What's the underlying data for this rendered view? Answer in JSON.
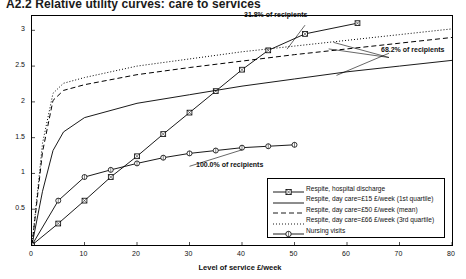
{
  "title": "A2.2  Relative utility curves: care to services",
  "axes": {
    "ylabel": "Change in perception",
    "xlabel": "Level of service £/week",
    "yticks": [
      "0.5",
      "1",
      "1.5",
      "2",
      "2.5",
      "3"
    ],
    "xticks": [
      "0",
      "10",
      "20",
      "30",
      "40",
      "50",
      "60",
      "70",
      "80"
    ]
  },
  "annotations": [
    {
      "text": "31.8% of recipients"
    },
    {
      "text": "68.2% of recipients"
    },
    {
      "text": "100.0% of recipients"
    }
  ],
  "legend": {
    "items": [
      {
        "label": "Respite, hospital discharge",
        "style": "solid-square-marker"
      },
      {
        "label": "Respite, day care=£15 £/week (1st quartile)",
        "style": "solid-line"
      },
      {
        "label": "Respite, day care=£50 £/week (mean)",
        "style": "dashed-line"
      },
      {
        "label": "Respite, day care=£66 £/week (3rd quartile)",
        "style": "dotted-line"
      },
      {
        "label": "Nursing visits",
        "style": "solid-circle-marker"
      }
    ]
  },
  "chart_data": {
    "type": "line",
    "title": "A2.2  Relative utility curves: care to services",
    "xlabel": "Level of service £/week",
    "ylabel": "Change in perception",
    "xlim": [
      0,
      80
    ],
    "ylim": [
      0,
      3.2
    ],
    "grid": false,
    "legend_position": "bottom-right",
    "series": [
      {
        "name": "Respite, hospital discharge",
        "marker": "square",
        "line": "solid",
        "color": "#000000",
        "points": [
          {
            "x": 0,
            "y": 0.0
          },
          {
            "x": 5,
            "y": 0.3
          },
          {
            "x": 10,
            "y": 0.62
          },
          {
            "x": 15,
            "y": 0.95
          },
          {
            "x": 20,
            "y": 1.24
          },
          {
            "x": 25,
            "y": 1.55
          },
          {
            "x": 30,
            "y": 1.85
          },
          {
            "x": 35,
            "y": 2.15
          },
          {
            "x": 40,
            "y": 2.45
          },
          {
            "x": 45,
            "y": 2.72
          },
          {
            "x": 52,
            "y": 2.95
          },
          {
            "x": 62,
            "y": 3.1
          }
        ]
      },
      {
        "name": "Respite, day care=£15 £/week (1st quartile)",
        "marker": "none",
        "line": "solid",
        "color": "#000000",
        "points": [
          {
            "x": 0,
            "y": 0.0
          },
          {
            "x": 2,
            "y": 0.75
          },
          {
            "x": 4,
            "y": 1.32
          },
          {
            "x": 6,
            "y": 1.58
          },
          {
            "x": 10,
            "y": 1.78
          },
          {
            "x": 20,
            "y": 1.98
          },
          {
            "x": 30,
            "y": 2.1
          },
          {
            "x": 40,
            "y": 2.22
          },
          {
            "x": 50,
            "y": 2.32
          },
          {
            "x": 60,
            "y": 2.42
          },
          {
            "x": 70,
            "y": 2.5
          },
          {
            "x": 80,
            "y": 2.58
          }
        ]
      },
      {
        "name": "Respite, day care=£50 £/week (mean)",
        "marker": "none",
        "line": "dashed",
        "color": "#000000",
        "points": [
          {
            "x": 0,
            "y": 0.0
          },
          {
            "x": 2,
            "y": 1.3
          },
          {
            "x": 4,
            "y": 2.02
          },
          {
            "x": 6,
            "y": 2.16
          },
          {
            "x": 10,
            "y": 2.24
          },
          {
            "x": 20,
            "y": 2.38
          },
          {
            "x": 30,
            "y": 2.48
          },
          {
            "x": 40,
            "y": 2.57
          },
          {
            "x": 50,
            "y": 2.66
          },
          {
            "x": 60,
            "y": 2.74
          },
          {
            "x": 70,
            "y": 2.82
          },
          {
            "x": 80,
            "y": 2.9
          }
        ]
      },
      {
        "name": "Respite, day care=£66 £/week (3rd quartile)",
        "marker": "none",
        "line": "dotted",
        "color": "#000000",
        "points": [
          {
            "x": 0,
            "y": 0.0
          },
          {
            "x": 2,
            "y": 1.42
          },
          {
            "x": 4,
            "y": 2.12
          },
          {
            "x": 6,
            "y": 2.26
          },
          {
            "x": 10,
            "y": 2.34
          },
          {
            "x": 20,
            "y": 2.5
          },
          {
            "x": 30,
            "y": 2.6
          },
          {
            "x": 40,
            "y": 2.7
          },
          {
            "x": 50,
            "y": 2.78
          },
          {
            "x": 60,
            "y": 2.86
          },
          {
            "x": 70,
            "y": 2.94
          },
          {
            "x": 80,
            "y": 3.02
          }
        ]
      },
      {
        "name": "Nursing visits",
        "marker": "circle",
        "line": "solid",
        "color": "#000000",
        "points": [
          {
            "x": 0,
            "y": 0.0
          },
          {
            "x": 5,
            "y": 0.62
          },
          {
            "x": 10,
            "y": 0.95
          },
          {
            "x": 15,
            "y": 1.05
          },
          {
            "x": 20,
            "y": 1.14
          },
          {
            "x": 25,
            "y": 1.22
          },
          {
            "x": 30,
            "y": 1.28
          },
          {
            "x": 35,
            "y": 1.32
          },
          {
            "x": 40,
            "y": 1.36
          },
          {
            "x": 45,
            "y": 1.38
          },
          {
            "x": 50,
            "y": 1.4
          }
        ]
      }
    ]
  }
}
